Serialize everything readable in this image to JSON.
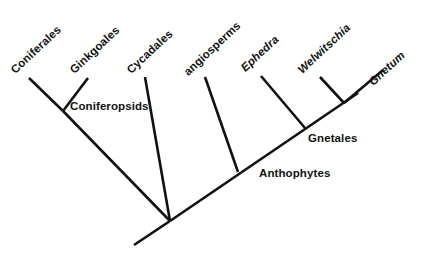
{
  "figure": {
    "type": "cladogram",
    "background_color": "#ffffff",
    "line_color": "#111111",
    "text_color": "#121212",
    "width": 431,
    "height": 258
  },
  "tips": [
    {
      "id": "coniferales",
      "label": "Coniferales",
      "italic": false,
      "x": 13,
      "y": 66,
      "rotation": -43
    },
    {
      "id": "ginkgoales",
      "label": "Ginkgoales",
      "italic": false,
      "x": 72,
      "y": 66,
      "rotation": -43
    },
    {
      "id": "cycadales",
      "label": "Cycadales",
      "italic": false,
      "x": 129,
      "y": 66,
      "rotation": -43
    },
    {
      "id": "angiosperms",
      "label": "angiosperms",
      "italic": false,
      "x": 186,
      "y": 68,
      "rotation": -43
    },
    {
      "id": "ephedra",
      "label": "Ephedra",
      "italic": true,
      "x": 243,
      "y": 64,
      "rotation": -43
    },
    {
      "id": "welwitschia",
      "label": "Welwitschia",
      "italic": true,
      "x": 300,
      "y": 66,
      "rotation": -43
    },
    {
      "id": "gnetum",
      "label": "Gnetum",
      "italic": true,
      "x": 371,
      "y": 78,
      "rotation": -43
    }
  ],
  "nodes": [
    {
      "id": "coniferopsids",
      "label": "Coniferopsids",
      "x": 70,
      "y": 101
    },
    {
      "id": "gnetales",
      "label": "Gnetales",
      "x": 308,
      "y": 133
    },
    {
      "id": "anthophytes",
      "label": "Anthophytes",
      "x": 259,
      "y": 168
    }
  ],
  "branches": [
    {
      "id": "branch-coniferales",
      "x1": 29,
      "y1": 78,
      "x2": 63,
      "y2": 111,
      "width": 2.6
    },
    {
      "id": "branch-ginkgoales",
      "x1": 88,
      "y1": 78,
      "x2": 63,
      "y2": 111,
      "width": 2.6
    },
    {
      "id": "branch-coniferopsids-stem",
      "x1": 63,
      "y1": 111,
      "x2": 170,
      "y2": 221,
      "width": 2.6
    },
    {
      "id": "branch-cycadales",
      "x1": 145,
      "y1": 77,
      "x2": 170,
      "y2": 221,
      "width": 2.6
    },
    {
      "id": "branch-root",
      "x1": 170,
      "y1": 221,
      "x2": 134,
      "y2": 245,
      "width": 2.6
    },
    {
      "id": "branch-backbone",
      "x1": 170,
      "y1": 221,
      "x2": 358,
      "y2": 93,
      "width": 2.6
    },
    {
      "id": "branch-angiosperms",
      "x1": 205,
      "y1": 77,
      "x2": 238,
      "y2": 172,
      "width": 2.6
    },
    {
      "id": "branch-ephedra",
      "x1": 261,
      "y1": 76,
      "x2": 305,
      "y2": 128,
      "width": 2.6
    },
    {
      "id": "branch-welwitschia",
      "x1": 320,
      "y1": 77,
      "x2": 344,
      "y2": 103,
      "width": 2.6
    },
    {
      "id": "branch-gnetum",
      "x1": 383,
      "y1": 70,
      "x2": 344,
      "y2": 103,
      "width": 2.6
    }
  ]
}
